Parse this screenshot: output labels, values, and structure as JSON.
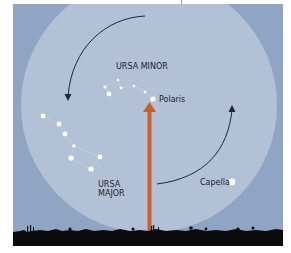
{
  "diagram": {
    "colors": {
      "sky_outer": "#90a4c4",
      "sky_circle": "#b3c1d7",
      "ground": "#0b0b0d",
      "pointer_arrow": "#c8602a",
      "rotation_arrow": "#1c2838",
      "star": "#ffffff",
      "star_line": "#d5dde9"
    },
    "labels": {
      "ursa_minor": "URSA MINOR",
      "polaris": "Polaris",
      "ursa_major_line1": "URSA",
      "ursa_major_line2": "MAJOR",
      "capella": "Capella"
    },
    "stars": {
      "ursa_minor": [
        {
          "x": 105,
          "y": 87,
          "r": 1.6
        },
        {
          "x": 109,
          "y": 94,
          "r": 2.4
        },
        {
          "x": 118,
          "y": 80,
          "r": 1.2
        },
        {
          "x": 121,
          "y": 88,
          "r": 1.4
        },
        {
          "x": 134,
          "y": 86,
          "r": 1.3
        },
        {
          "x": 145,
          "y": 92,
          "r": 1.4
        }
      ],
      "polaris": {
        "x": 153,
        "y": 99,
        "r": 2.6
      },
      "ursa_major": [
        {
          "x": 43,
          "y": 116,
          "r": 2.4
        },
        {
          "x": 59,
          "y": 124,
          "r": 2.4
        },
        {
          "x": 65,
          "y": 134,
          "r": 2.4
        },
        {
          "x": 74,
          "y": 146,
          "r": 1.8
        },
        {
          "x": 71,
          "y": 158,
          "r": 2.6
        },
        {
          "x": 100,
          "y": 157,
          "r": 2.4
        },
        {
          "x": 91,
          "y": 169,
          "r": 2.6
        }
      ],
      "capella": {
        "x": 232,
        "y": 182,
        "r": 3.4
      }
    }
  }
}
